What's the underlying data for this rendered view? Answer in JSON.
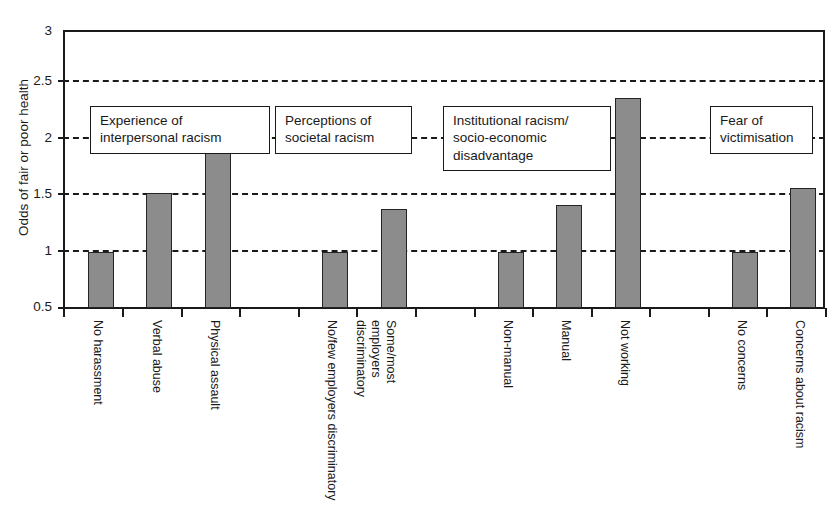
{
  "chart_data": {
    "type": "bar",
    "title": "",
    "xlabel": "",
    "ylabel": "Odds of fair or poor health",
    "ylim": [
      0.5,
      3
    ],
    "yticks": [
      "0.5",
      "1",
      "1.5",
      "2",
      "2.5",
      "3"
    ],
    "gridlines": [
      1,
      1.5,
      2,
      2.5
    ],
    "grid": true,
    "legend": "none",
    "bar_color": "#8c8c8c",
    "bar_edge_color": "#242424",
    "categories": [
      "No harassment",
      "Verbal abuse",
      "Physical assault",
      "No/few employers discriminatory",
      "Some/most employers discriminatory",
      "Non-manual",
      "Manual",
      "Not working",
      "No concerns",
      "Concerns about racism"
    ],
    "values": [
      1.0,
      1.53,
      2.07,
      1.0,
      1.39,
      1.0,
      1.43,
      2.39,
      1.0,
      1.58
    ],
    "groups": [
      {
        "label_line1": "Experience of",
        "label_line2": "interpersonal racism",
        "label_line3": "",
        "categories": [
          "No harassment",
          "Verbal abuse",
          "Physical assault"
        ],
        "values": [
          1.0,
          1.53,
          2.07
        ]
      },
      {
        "label_line1": "Perceptions of",
        "label_line2": "societal racism",
        "label_line3": "",
        "categories": [
          "No/few employers discriminatory",
          "Some/most employers discriminatory"
        ],
        "values": [
          1.0,
          1.39
        ]
      },
      {
        "label_line1": "Institutional racism/",
        "label_line2": "socio-economic",
        "label_line3": "disadvantage",
        "categories": [
          "Non-manual",
          "Manual",
          "Not working"
        ],
        "values": [
          1.0,
          1.43,
          2.39
        ]
      },
      {
        "label_line1": "Fear of",
        "label_line2": "victimisation",
        "label_line3": "",
        "categories": [
          "No concerns",
          "Concerns about racism"
        ],
        "values": [
          1.0,
          1.58
        ]
      }
    ]
  },
  "axis": {
    "y_label": "Odds of fair or poor health",
    "y_ticks": [
      "3",
      "2.5",
      "2",
      "1.5",
      "1",
      "0.5"
    ]
  },
  "annotations": [
    {
      "line1": "Experience of",
      "line2": "interpersonal racism",
      "line3": ""
    },
    {
      "line1": "Perceptions of",
      "line2": "societal racism",
      "line3": ""
    },
    {
      "line1": "Institutional racism/",
      "line2": "socio-economic",
      "line3": "disadvantage"
    },
    {
      "line1": "Fear of",
      "line2": "victimisation",
      "line3": ""
    }
  ],
  "categories": [
    "No harassment",
    "Verbal abuse",
    "Physical assault",
    "No/few employers discriminatory",
    "Some/most employers discriminatory",
    "Non-manual",
    "Manual",
    "Not working",
    "No concerns",
    "Concerns about racism"
  ]
}
